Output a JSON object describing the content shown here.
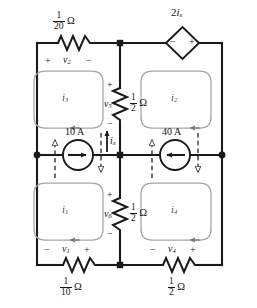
{
  "figure": {
    "type": "electrical-circuit-schematic"
  },
  "components": {
    "r2_top_left": {
      "name": "resistor-r2",
      "value_num": "1",
      "value_den": "20",
      "unit": "Ω",
      "voltage_label": "v",
      "voltage_sub": "2",
      "polarity_left": "+",
      "polarity_right": "−"
    },
    "r1_bottom_left": {
      "name": "resistor-r1",
      "value_num": "1",
      "value_den": "10",
      "unit": "Ω",
      "voltage_label": "v",
      "voltage_sub": "1",
      "polarity_left": "−",
      "polarity_right": "+"
    },
    "r4_bottom_right": {
      "name": "resistor-r4",
      "value_num": "1",
      "value_den": "2",
      "unit": "Ω",
      "voltage_label": "v",
      "voltage_sub": "4",
      "polarity_left": "−",
      "polarity_right": "+"
    },
    "r5_mid_upper": {
      "name": "resistor-r5",
      "value_num": "1",
      "value_den": "2",
      "unit": "Ω",
      "voltage_label": "v",
      "voltage_sub": "5",
      "polarity_top": "+",
      "polarity_bottom": "−"
    },
    "r6_mid_lower": {
      "name": "resistor-r6",
      "value_num": "1",
      "value_den": "2",
      "unit": "Ω",
      "voltage_label": "v",
      "voltage_sub": "6",
      "polarity_top": "+",
      "polarity_bottom": "−"
    },
    "dependent_source": {
      "name": "dependent-voltage-source",
      "label_coeff": "2",
      "label_var": "i",
      "label_sub": "x",
      "terminal_left": "−",
      "terminal_right": "+",
      "shape": "diamond"
    },
    "source_10a": {
      "name": "current-source-10a",
      "label": "10 A",
      "direction": "right"
    },
    "source_40a": {
      "name": "current-source-40a",
      "label": "40 A",
      "direction": "left"
    },
    "control_current": {
      "name": "controlling-current-ix",
      "label_var": "i",
      "label_sub": "x",
      "direction": "up"
    }
  },
  "meshes": [
    {
      "id": "mesh-i1",
      "label_var": "i",
      "label_sub": "1",
      "position": "bottom-left"
    },
    {
      "id": "mesh-i2",
      "label_var": "i",
      "label_sub": "2",
      "position": "top-right"
    },
    {
      "id": "mesh-i3",
      "label_var": "i",
      "label_sub": "3",
      "position": "top-left"
    },
    {
      "id": "mesh-i4",
      "label_var": "i",
      "label_sub": "4",
      "position": "bottom-right"
    }
  ],
  "colors": {
    "wire": "#1a1a1a",
    "mesh_loop": "#9a9a9a",
    "dashed_arrow": "#2b2b2b",
    "background": "#ffffff",
    "text": "#151515"
  }
}
